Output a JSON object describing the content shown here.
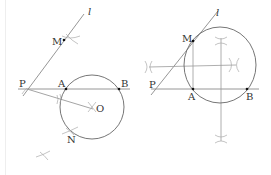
{
  "figures": [
    {
      "id": "left",
      "labels": {
        "l": "l",
        "M": "M",
        "P": "P",
        "A": "A",
        "B": "B",
        "O": "O",
        "N": "N"
      }
    },
    {
      "id": "right",
      "labels": {
        "l": "l",
        "M": "M",
        "P": "P",
        "A": "A",
        "B": "B"
      }
    }
  ],
  "colors": {
    "stroke": "#555555",
    "construction": "#9a9a9a",
    "point": "#111111",
    "text": "#333333"
  }
}
